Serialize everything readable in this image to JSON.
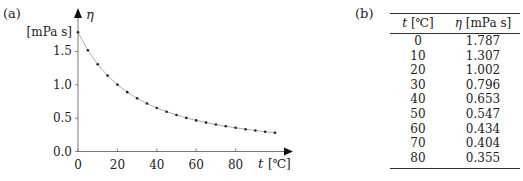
{
  "panels": {
    "a": "(a)",
    "b": "(b)"
  },
  "chart_data": {
    "type": "line",
    "title": "",
    "xlabel_var": "t",
    "xlabel_unit": "[℃]",
    "ylabel_var": "η",
    "ylabel_unit": "[mPa s]",
    "xlim": [
      0,
      100
    ],
    "ylim": [
      0,
      1.8
    ],
    "xticks": [
      "0",
      "20",
      "40",
      "60",
      "80"
    ],
    "yticks": [
      "0.0",
      "0.5",
      "1.0",
      "1.5"
    ],
    "grid": false,
    "legend": null,
    "series": [
      {
        "name": "viscosity of water",
        "style": "markers on smooth curve",
        "x": [
          0,
          5,
          10,
          15,
          20,
          25,
          30,
          35,
          40,
          45,
          50,
          55,
          60,
          65,
          70,
          75,
          80,
          85,
          90,
          95,
          100
        ],
        "y": [
          1.787,
          1.519,
          1.307,
          1.138,
          1.002,
          0.89,
          0.797,
          0.719,
          0.653,
          0.596,
          0.547,
          0.504,
          0.466,
          0.433,
          0.404,
          0.378,
          0.355,
          0.333,
          0.315,
          0.297,
          0.282
        ]
      }
    ]
  },
  "table": {
    "headers": {
      "t_var": "t",
      "t_unit": "[℃]",
      "eta_var": "η",
      "eta_unit": "[mPa s]"
    },
    "rows": [
      {
        "t": "0",
        "eta": "1.787"
      },
      {
        "t": "10",
        "eta": "1.307"
      },
      {
        "t": "20",
        "eta": "1.002"
      },
      {
        "t": "30",
        "eta": "0.796"
      },
      {
        "t": "40",
        "eta": "0.653"
      },
      {
        "t": "50",
        "eta": "0.547"
      },
      {
        "t": "60",
        "eta": "0.434"
      },
      {
        "t": "70",
        "eta": "0.404"
      },
      {
        "t": "80",
        "eta": "0.355"
      }
    ]
  }
}
